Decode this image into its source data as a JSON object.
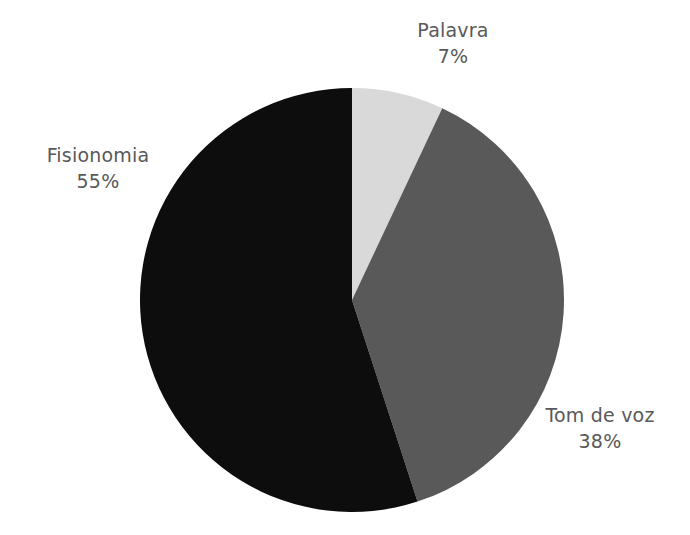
{
  "background_color": "#ffffff",
  "label_color": "#595959",
  "chart_data": {
    "type": "pie",
    "title": "",
    "subtitle": "",
    "xlabel": "",
    "ylabel": "",
    "legend": "none",
    "grid": false,
    "start_angle_deg": 0,
    "direction": "clockwise",
    "center": {
      "x": 352,
      "y": 300
    },
    "radius": 212,
    "categories": [
      "Palavra",
      "Tom de voz",
      "Fisionomia"
    ],
    "values": [
      7,
      38,
      55
    ],
    "value_unit": "%",
    "colors": [
      "#d9d9d9",
      "#595959",
      "#0d0d0d"
    ],
    "slices": [
      {
        "name": "Palavra",
        "value": 7,
        "value_label": "7%",
        "color": "#d9d9d9",
        "start_angle_deg": 0,
        "end_angle_deg": 25.2
      },
      {
        "name": "Tom de voz",
        "value": 38,
        "value_label": "38%",
        "color": "#595959",
        "start_angle_deg": 25.2,
        "end_angle_deg": 162.0
      },
      {
        "name": "Fisionomia",
        "value": 55,
        "value_label": "55%",
        "color": "#0d0d0d",
        "start_angle_deg": 162.0,
        "end_angle_deg": 360.0
      }
    ]
  },
  "labels": {
    "palavra": {
      "name": "Palavra",
      "value": "7%"
    },
    "tom_de_voz": {
      "name": "Tom de voz",
      "value": "38%"
    },
    "fisionomia": {
      "name": "Fisionomia",
      "value": "55%"
    }
  }
}
